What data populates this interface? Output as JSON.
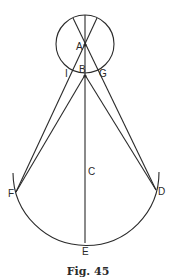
{
  "figure": {
    "caption": "Fig. 45",
    "labels": {
      "A": "A",
      "B": "B",
      "C": "C",
      "D": "D",
      "E": "E",
      "F": "F",
      "G": "G",
      "I": "I"
    },
    "colors": {
      "stroke": "#2a2a2a",
      "background": "#ffffff"
    }
  }
}
